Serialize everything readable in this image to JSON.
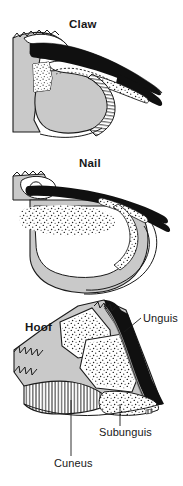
{
  "figure": {
    "background_color": "#ffffff",
    "ink_color": "#171717",
    "keratin_black_color": "#101010",
    "corium_gray_color": "#c9c9c9",
    "white_fill_color": "#ffffff",
    "width": 183,
    "height": 486
  },
  "panels": [
    {
      "id": "claw",
      "label": "Claw",
      "order": 1,
      "features": [
        "unguis",
        "subunguis",
        "cuneus"
      ]
    },
    {
      "id": "nail",
      "label": "Nail",
      "order": 2,
      "features": [
        "unguis",
        "subunguis"
      ]
    },
    {
      "id": "hoof",
      "label": "Hoof",
      "order": 3,
      "features": [
        "unguis",
        "subunguis",
        "cuneus"
      ]
    }
  ],
  "callouts": [
    {
      "id": "unguis",
      "label": "Unguis",
      "panel": "hoof",
      "leader": "diagonal",
      "description": "black keratinized outer wall"
    },
    {
      "id": "subunguis",
      "label": "Subunguis",
      "panel": "hoof",
      "leader": "vertical",
      "description": "stippled sole layer"
    },
    {
      "id": "cuneus",
      "label": "Cuneus",
      "panel": "hoof",
      "leader": "vertical",
      "description": "hatched frog wedge"
    }
  ]
}
